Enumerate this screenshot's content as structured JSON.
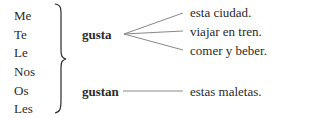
{
  "pronouns": [
    "Me",
    "Te",
    "Le",
    "Nos",
    "Os",
    "Les"
  ],
  "verbs": {
    "singular": "gusta",
    "plural": "gustan"
  },
  "singular_objects": [
    "esta ciudad.",
    "viajar en tren.",
    "comer y beber."
  ],
  "plural_objects": [
    "estas maletas."
  ],
  "colors": {
    "text": "#2a2a2a",
    "lines": "#888888"
  }
}
